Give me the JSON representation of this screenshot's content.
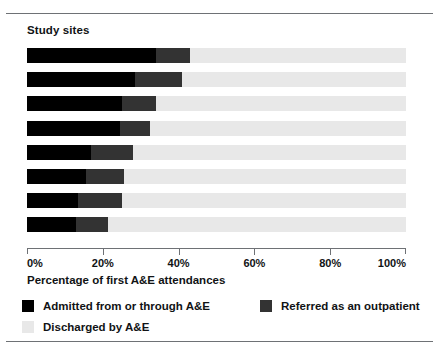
{
  "chart_data": {
    "type": "bar",
    "orientation": "horizontal",
    "stacked": true,
    "title": "Study sites",
    "xlabel": "Percentage of first A&E attendances",
    "ylabel": "",
    "xlim": [
      0,
      100
    ],
    "xticks": [
      0,
      20,
      40,
      60,
      80,
      100
    ],
    "xticklabels": [
      "0%",
      "20%",
      "40%",
      "60%",
      "80%",
      "100%"
    ],
    "grid": false,
    "legend_position": "bottom",
    "categories": [
      "Site 1",
      "Site 2",
      "Site 3",
      "Site 4",
      "Site 5",
      "Site 6",
      "Site 7",
      "Site 8"
    ],
    "category_labels_visible": false,
    "series": [
      {
        "name": "Admitted from or through A&E",
        "color": "#000000",
        "values": [
          34.0,
          28.5,
          25.0,
          24.5,
          17.0,
          15.5,
          13.5,
          13.0
        ]
      },
      {
        "name": "Referred as an outpatient",
        "color": "#333333",
        "values": [
          9.0,
          12.5,
          9.0,
          8.0,
          11.0,
          10.0,
          11.5,
          8.5
        ]
      },
      {
        "name": "Discharged by A&E",
        "color": "#e8e8e8",
        "values": [
          57.0,
          59.0,
          66.0,
          67.5,
          72.0,
          74.5,
          75.0,
          78.5
        ]
      }
    ]
  },
  "legend": {
    "items": [
      {
        "label": "Admitted from or through A&E",
        "color": "#000000"
      },
      {
        "label": "Referred as an outpatient",
        "color": "#333333"
      },
      {
        "label": "Discharged by A&E",
        "color": "#e8e8e8"
      }
    ]
  }
}
